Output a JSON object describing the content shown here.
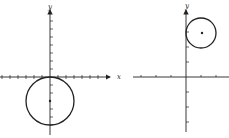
{
  "figures": [
    {
      "name": "left-graph",
      "axis_labels": {
        "x": "x",
        "y": "y"
      },
      "circle": {
        "center": [
          0,
          -3
        ],
        "radius": 3,
        "note": "tangent to x-axis at origin"
      },
      "origin_px": [
        50,
        77
      ],
      "unit_px": 8
    },
    {
      "name": "right-graph",
      "axis_labels": {
        "x": "",
        "y": "y"
      },
      "circle": {
        "center": [
          1,
          3
        ],
        "radius": 1,
        "note": "tangent to y-axis"
      },
      "origin_px": [
        186,
        77
      ],
      "unit_px": 15
    }
  ],
  "colors": {
    "ink": "#222222",
    "background": "#ffffff"
  }
}
